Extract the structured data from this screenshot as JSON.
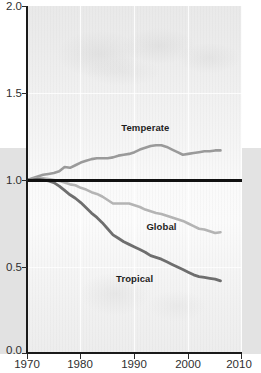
{
  "chart_data": {
    "type": "line",
    "title": "",
    "subtitle": "",
    "xlabel": "",
    "ylabel": "",
    "xlim": [
      1970,
      2010
    ],
    "ylim": [
      0.0,
      2.0
    ],
    "xticks": [
      1970,
      1980,
      1990,
      2000,
      2010
    ],
    "yticks": [
      0.0,
      0.5,
      1.0,
      1.5,
      2.0
    ],
    "xtick_labels": [
      "1970",
      "1980",
      "1990",
      "2000",
      "2010"
    ],
    "ytick_labels": [
      "0.0",
      "0.5",
      "1.0",
      "1.5",
      "2.0"
    ],
    "grid": "faint white vertical gridlines at decades, faint horizontal gridlines at 0.5 intervals",
    "legend_position": "inline labels next to each line",
    "reference_line": {
      "value": 1.0,
      "color": "#111111",
      "label": "index baseline 1.0"
    },
    "series": [
      {
        "name": "Temperate",
        "color": "#9a9a9a",
        "label_x": 1992,
        "label_y": 1.305,
        "x": [
          1970,
          1971,
          1972,
          1973,
          1974,
          1975,
          1976,
          1977,
          1978,
          1979,
          1980,
          1981,
          1982,
          1983,
          1984,
          1985,
          1986,
          1987,
          1988,
          1989,
          1990,
          1991,
          1992,
          1993,
          1994,
          1995,
          1996,
          1997,
          1998,
          1999,
          2000,
          2001,
          2002,
          2003,
          2004,
          2005,
          2006
        ],
        "y": [
          1.0,
          1.01,
          1.02,
          1.03,
          1.035,
          1.04,
          1.05,
          1.075,
          1.07,
          1.085,
          1.1,
          1.11,
          1.12,
          1.125,
          1.125,
          1.125,
          1.13,
          1.14,
          1.145,
          1.15,
          1.16,
          1.175,
          1.185,
          1.195,
          1.2,
          1.2,
          1.19,
          1.175,
          1.16,
          1.145,
          1.15,
          1.155,
          1.16,
          1.165,
          1.165,
          1.17,
          1.17
        ]
      },
      {
        "name": "Global",
        "color": "#b4b4b4",
        "label_x": 1995,
        "label_y": 0.735,
        "x": [
          1970,
          1971,
          1972,
          1973,
          1974,
          1975,
          1976,
          1977,
          1978,
          1979,
          1980,
          1981,
          1982,
          1983,
          1984,
          1985,
          1986,
          1987,
          1988,
          1989,
          1990,
          1991,
          1992,
          1993,
          1994,
          1995,
          1996,
          1997,
          1998,
          1999,
          2000,
          2001,
          2002,
          2003,
          2004,
          2005,
          2006
        ],
        "y": [
          1.0,
          1.005,
          1.01,
          1.01,
          1.005,
          1.0,
          0.995,
          0.985,
          0.975,
          0.97,
          0.955,
          0.945,
          0.93,
          0.92,
          0.905,
          0.885,
          0.865,
          0.865,
          0.865,
          0.865,
          0.855,
          0.845,
          0.83,
          0.82,
          0.81,
          0.805,
          0.795,
          0.785,
          0.775,
          0.765,
          0.75,
          0.735,
          0.72,
          0.715,
          0.705,
          0.695,
          0.7
        ]
      },
      {
        "name": "Tropical",
        "color": "#6e6e6e",
        "label_x": 1990,
        "label_y": 0.435,
        "x": [
          1970,
          1971,
          1972,
          1973,
          1974,
          1975,
          1976,
          1977,
          1978,
          1979,
          1980,
          1981,
          1982,
          1983,
          1984,
          1985,
          1986,
          1987,
          1988,
          1989,
          1990,
          1991,
          1992,
          1993,
          1994,
          1995,
          1996,
          1997,
          1998,
          1999,
          2000,
          2001,
          2002,
          2003,
          2004,
          2005,
          2006
        ],
        "y": [
          1.0,
          1.0,
          1.005,
          1.0,
          0.995,
          0.985,
          0.965,
          0.94,
          0.915,
          0.895,
          0.87,
          0.84,
          0.81,
          0.785,
          0.755,
          0.72,
          0.685,
          0.665,
          0.645,
          0.63,
          0.615,
          0.6,
          0.585,
          0.565,
          0.555,
          0.545,
          0.53,
          0.515,
          0.5,
          0.485,
          0.47,
          0.455,
          0.445,
          0.44,
          0.435,
          0.43,
          0.42
        ]
      }
    ]
  },
  "axes": {
    "y_tick_labels": [
      "2.0",
      "1.5",
      "1.0",
      "0.5",
      "0.0"
    ],
    "x_tick_labels": [
      "1970",
      "1980",
      "1990",
      "2000",
      "2010"
    ]
  },
  "series_labels": {
    "temperate": "Temperate",
    "global": "Global",
    "tropical": "Tropical"
  },
  "colors": {
    "temperate": "#9a9a9a",
    "global": "#b4b4b4",
    "tropical": "#6e6e6e",
    "reference_line": "#111111",
    "axis": "#1a1a1a"
  }
}
